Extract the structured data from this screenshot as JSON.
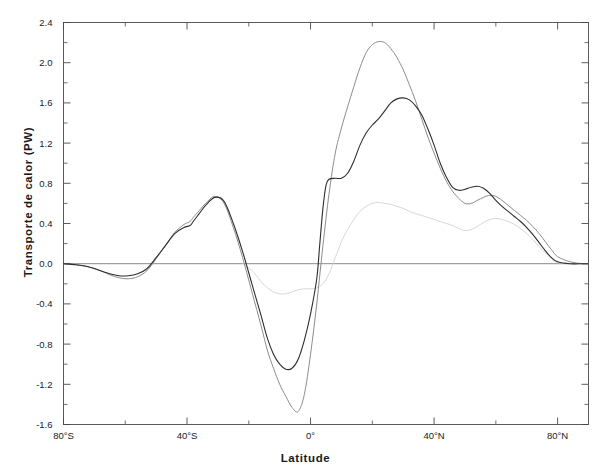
{
  "figure": {
    "background_color": "#ffffff",
    "width": 611,
    "height": 475
  },
  "axes": {
    "xlabel": "Latitude",
    "ylabel": "Transporte de calor (PW)",
    "x_tick_labels": [
      "80°S",
      "40°S",
      "0°",
      "40°N",
      "80°N"
    ],
    "y_tick_labels": [
      "2.4",
      "2.0",
      "1.6",
      "1.2",
      "0.8",
      "0.4",
      "0.0",
      "-0.4",
      "-0.8",
      "-1.2",
      "-1.6"
    ],
    "frame_color": "#4a4a4a",
    "zero_line_color": "#6b6b6b"
  },
  "chart_data": {
    "type": "line",
    "title": "",
    "subtitle": "",
    "xlabel": "Latitude",
    "ylabel": "Transporte de calor (PW)",
    "xlim": [
      -80,
      90
    ],
    "ylim": [
      -1.6,
      2.4
    ],
    "xticks": [
      -80,
      -40,
      0,
      40,
      80
    ],
    "xtick_labels": [
      "80°S",
      "40°S",
      "0°",
      "40°N",
      "80°N"
    ],
    "xticks_minor": [
      -60,
      -20,
      20,
      60
    ],
    "yticks": [
      2.4,
      2.0,
      1.6,
      1.2,
      0.8,
      0.4,
      0.0,
      -0.4,
      -0.8,
      -1.2,
      -1.6
    ],
    "yticks_minor": [
      2.2,
      1.8,
      1.4,
      1.0,
      0.6,
      0.2,
      -0.2,
      -0.6,
      -1.0,
      -1.4
    ],
    "grid": false,
    "legend": null,
    "legend_position": "none",
    "annotations": [],
    "series": [
      {
        "name": "total-dark",
        "color": "#2e2e2e",
        "width": 1.1,
        "x": [
          -80,
          -76,
          -72,
          -68,
          -65,
          -62,
          -59,
          -56,
          -53,
          -50,
          -47,
          -44,
          -41,
          -39,
          -38,
          -36,
          -34,
          -31,
          -28,
          -25,
          -22,
          -19,
          -16,
          -14,
          -12,
          -10,
          -8,
          -6,
          -4,
          -2,
          0,
          2,
          3,
          4,
          5,
          6,
          8,
          10,
          12,
          14,
          16,
          18,
          20,
          22,
          24,
          26,
          28,
          30,
          32,
          34,
          36,
          38,
          40,
          42,
          44,
          46,
          48,
          50,
          52,
          54,
          56,
          58,
          60,
          62,
          64,
          66,
          68,
          70,
          72,
          74,
          76,
          78,
          80,
          84,
          88,
          90
        ],
        "y": [
          0.0,
          -0.01,
          -0.03,
          -0.07,
          -0.1,
          -0.12,
          -0.12,
          -0.1,
          -0.05,
          0.06,
          0.18,
          0.3,
          0.36,
          0.38,
          0.42,
          0.5,
          0.58,
          0.66,
          0.62,
          0.4,
          0.12,
          -0.2,
          -0.52,
          -0.74,
          -0.9,
          -1.0,
          -1.05,
          -1.04,
          -0.95,
          -0.76,
          -0.5,
          -0.15,
          0.2,
          0.55,
          0.78,
          0.84,
          0.85,
          0.85,
          0.9,
          1.02,
          1.18,
          1.3,
          1.38,
          1.44,
          1.52,
          1.6,
          1.64,
          1.65,
          1.63,
          1.57,
          1.48,
          1.34,
          1.18,
          1.0,
          0.86,
          0.76,
          0.73,
          0.74,
          0.76,
          0.77,
          0.75,
          0.7,
          0.63,
          0.57,
          0.52,
          0.47,
          0.42,
          0.36,
          0.29,
          0.21,
          0.13,
          0.06,
          0.02,
          0.0,
          0.0,
          0.0
        ]
      },
      {
        "name": "total-light",
        "color": "#8c8c8c",
        "width": 1.0,
        "x": [
          -80,
          -76,
          -72,
          -68,
          -65,
          -62,
          -59,
          -56,
          -53,
          -50,
          -47,
          -44,
          -41,
          -39,
          -38,
          -36,
          -34,
          -31,
          -28,
          -25,
          -22,
          -19,
          -16,
          -14,
          -12,
          -10,
          -8,
          -6,
          -4,
          -2,
          0,
          2,
          4,
          6,
          8,
          10,
          12,
          14,
          16,
          18,
          20,
          22,
          24,
          26,
          28,
          30,
          32,
          34,
          36,
          38,
          40,
          42,
          44,
          46,
          48,
          50,
          52,
          54,
          56,
          58,
          60,
          62,
          64,
          66,
          68,
          70,
          72,
          74,
          76,
          78,
          80,
          84,
          88,
          90
        ],
        "y": [
          0.0,
          -0.01,
          -0.03,
          -0.07,
          -0.11,
          -0.14,
          -0.15,
          -0.13,
          -0.07,
          0.05,
          0.18,
          0.31,
          0.39,
          0.42,
          0.46,
          0.53,
          0.6,
          0.67,
          0.6,
          0.36,
          0.06,
          -0.28,
          -0.62,
          -0.86,
          -1.04,
          -1.2,
          -1.32,
          -1.43,
          -1.47,
          -1.3,
          -0.9,
          -0.4,
          0.18,
          0.7,
          1.1,
          1.35,
          1.56,
          1.76,
          1.95,
          2.1,
          2.18,
          2.21,
          2.2,
          2.14,
          2.05,
          1.93,
          1.78,
          1.62,
          1.44,
          1.26,
          1.1,
          0.95,
          0.82,
          0.72,
          0.65,
          0.6,
          0.6,
          0.63,
          0.66,
          0.68,
          0.67,
          0.63,
          0.58,
          0.53,
          0.48,
          0.43,
          0.37,
          0.3,
          0.22,
          0.14,
          0.07,
          0.02,
          0.0,
          0.0
        ]
      },
      {
        "name": "component-faint",
        "color": "#d2d2d2",
        "width": 0.9,
        "x": [
          -22,
          -20,
          -18,
          -16,
          -14,
          -12,
          -10,
          -8,
          -6,
          -4,
          -2,
          0,
          2,
          4,
          6,
          8,
          10,
          12,
          14,
          16,
          18,
          20,
          22,
          24,
          26,
          28,
          30,
          32,
          34,
          36,
          38,
          40,
          42,
          44,
          46,
          48,
          50,
          52,
          54,
          56,
          58,
          60,
          62,
          64,
          66,
          68,
          70,
          72,
          74,
          76,
          78,
          80,
          84,
          88,
          90
        ],
        "y": [
          0.0,
          -0.04,
          -0.1,
          -0.18,
          -0.24,
          -0.28,
          -0.3,
          -0.3,
          -0.28,
          -0.26,
          -0.25,
          -0.25,
          -0.24,
          -0.2,
          -0.1,
          0.06,
          0.22,
          0.34,
          0.44,
          0.52,
          0.57,
          0.6,
          0.61,
          0.6,
          0.59,
          0.57,
          0.55,
          0.52,
          0.5,
          0.48,
          0.46,
          0.44,
          0.42,
          0.4,
          0.38,
          0.35,
          0.33,
          0.34,
          0.37,
          0.41,
          0.44,
          0.45,
          0.44,
          0.42,
          0.39,
          0.35,
          0.3,
          0.24,
          0.17,
          0.11,
          0.05,
          0.01,
          0.0,
          0.0,
          0.0
        ]
      }
    ]
  }
}
